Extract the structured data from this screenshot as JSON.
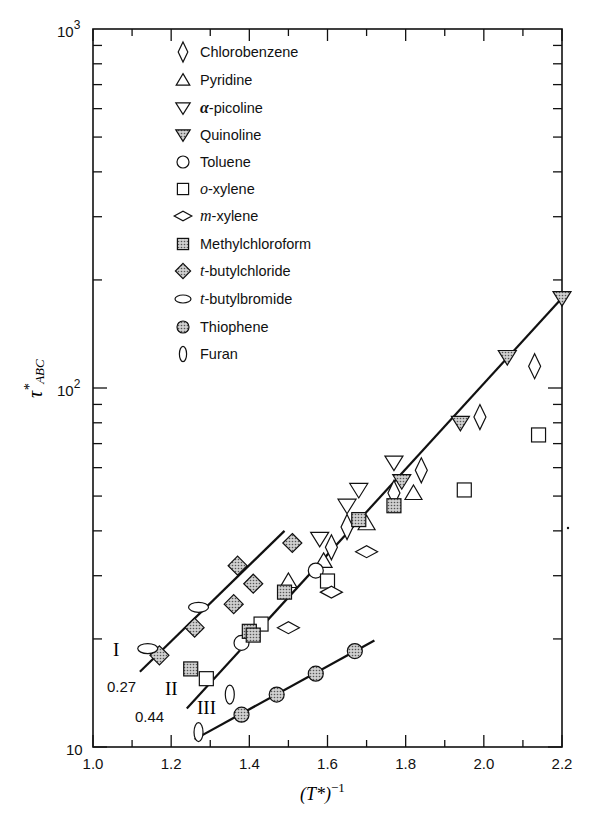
{
  "chart_data": {
    "type": "scatter",
    "title": "",
    "xlabel": "(T*)^-1",
    "ylabel": "τ*ABC",
    "xlim": [
      1.0,
      2.2
    ],
    "ylim": [
      10,
      1000
    ],
    "yscale": "log",
    "grid": false,
    "legend_position": "upper-left inside",
    "x_ticks": [
      "1.0",
      "1.2",
      "1.4",
      "1.6",
      "1.8",
      "2.0",
      "2.2"
    ],
    "y_ticks": [
      "10",
      "10^2",
      "10^3"
    ],
    "series": [
      {
        "name": "Chlorobenzene",
        "marker": "diamond-tall-open",
        "points": [
          [
            1.61,
            36
          ],
          [
            1.65,
            41
          ],
          [
            1.77,
            51
          ],
          [
            1.84,
            59
          ],
          [
            1.99,
            83
          ],
          [
            2.13,
            115
          ]
        ]
      },
      {
        "name": "Pyridine",
        "marker": "triangle-up-open",
        "points": [
          [
            1.5,
            29
          ],
          [
            1.7,
            42
          ],
          [
            1.82,
            51
          ],
          [
            1.59,
            33
          ]
        ]
      },
      {
        "name": "α-picoline",
        "marker": "triangle-down-open",
        "points": [
          [
            1.58,
            38
          ],
          [
            1.65,
            47
          ],
          [
            1.77,
            62
          ],
          [
            1.68,
            52
          ]
        ]
      },
      {
        "name": "Quinoline",
        "marker": "triangle-down-shaded",
        "points": [
          [
            1.79,
            55
          ],
          [
            1.94,
            80
          ],
          [
            2.06,
            122
          ],
          [
            2.2,
            178
          ]
        ]
      },
      {
        "name": "Toluene",
        "marker": "circle-open",
        "points": [
          [
            1.38,
            19.5
          ],
          [
            1.57,
            31
          ]
        ]
      },
      {
        "name": "o-xylene",
        "marker": "square-open",
        "points": [
          [
            1.29,
            15.5
          ],
          [
            1.43,
            22
          ],
          [
            1.6,
            29
          ],
          [
            1.95,
            52
          ],
          [
            2.14,
            74
          ]
        ]
      },
      {
        "name": "m-xylene",
        "marker": "diamond-wide-open",
        "points": [
          [
            1.5,
            21.5
          ],
          [
            1.61,
            27
          ],
          [
            1.7,
            35
          ]
        ]
      },
      {
        "name": "Methylchloroform",
        "marker": "square-shaded",
        "points": [
          [
            1.25,
            16.5
          ],
          [
            1.4,
            21
          ],
          [
            1.41,
            20.5
          ],
          [
            1.49,
            27
          ],
          [
            1.68,
            43
          ],
          [
            1.77,
            47
          ]
        ]
      },
      {
        "name": "t-butylchloride",
        "marker": "diamond-shaded",
        "points": [
          [
            1.17,
            18
          ],
          [
            1.26,
            21.5
          ],
          [
            1.36,
            25
          ],
          [
            1.37,
            32
          ],
          [
            1.41,
            28.5
          ],
          [
            1.51,
            37
          ]
        ]
      },
      {
        "name": "t-butylbromide",
        "marker": "ellipse-wide-open",
        "points": [
          [
            1.14,
            18.8
          ],
          [
            1.27,
            24.5
          ]
        ]
      },
      {
        "name": "Thiophene",
        "marker": "circle-shaded",
        "points": [
          [
            1.38,
            12.3
          ],
          [
            1.47,
            14
          ],
          [
            1.57,
            16
          ],
          [
            1.67,
            18.5
          ]
        ]
      },
      {
        "name": "Furan",
        "marker": "ellipse-tall-open",
        "points": [
          [
            1.27,
            11
          ],
          [
            1.35,
            14
          ]
        ]
      }
    ],
    "fit_lines": [
      {
        "label": "I",
        "slope_label": "0.27",
        "from": [
          1.12,
          16.2
        ],
        "to": [
          1.49,
          40
        ]
      },
      {
        "label": "II",
        "slope_label": "0.44",
        "from": [
          1.24,
          12.8
        ],
        "to": [
          2.2,
          178
        ]
      },
      {
        "label": "III",
        "slope_label": "",
        "from": [
          1.26,
          10.5
        ],
        "to": [
          1.72,
          19.8
        ]
      }
    ],
    "annotations": [
      "I",
      "0.27",
      "II",
      "0.44",
      "III"
    ]
  },
  "axes": {
    "x_label_main": "(T*)",
    "x_label_sup": "−1",
    "y_label_main": "τ",
    "y_label_star": "*",
    "y_label_sub": "ABC",
    "y_tick_10": "10",
    "y_tick_100_base": "10",
    "y_tick_100_exp": "2",
    "y_tick_1000_base": "10",
    "y_tick_1000_exp": "3"
  },
  "legend": {
    "items": [
      {
        "label": "Chlorobenzene",
        "marker": "diamond-tall-open"
      },
      {
        "label": "Pyridine",
        "marker": "triangle-up-open"
      },
      {
        "label": "α-picoline",
        "marker": "triangle-down-open"
      },
      {
        "label": "Quinoline",
        "marker": "triangle-down-shaded"
      },
      {
        "label": "Toluene",
        "marker": "circle-open"
      },
      {
        "label": "o-xylene",
        "marker": "square-open"
      },
      {
        "label": "m-xylene",
        "marker": "diamond-wide-open"
      },
      {
        "label": "Methylchloroform",
        "marker": "square-shaded"
      },
      {
        "label": "t-butylchloride",
        "marker": "diamond-shaded"
      },
      {
        "label": "t-butylbromide",
        "marker": "ellipse-wide-open"
      },
      {
        "label": "Thiophene",
        "marker": "circle-shaded"
      },
      {
        "label": "Furan",
        "marker": "ellipse-tall-open"
      }
    ]
  },
  "colors": {
    "ink": "#111111",
    "shade": "#b8b8b8",
    "background": "#ffffff"
  }
}
